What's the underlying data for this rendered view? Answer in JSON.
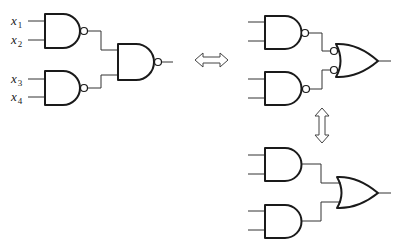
{
  "diagram": {
    "colors": {
      "stroke": "#1a1a1a",
      "wire": "#333333",
      "background": "#ffffff"
    },
    "inputs": [
      {
        "var": "x",
        "sub": "1"
      },
      {
        "var": "x",
        "sub": "2"
      },
      {
        "var": "x",
        "sub": "3"
      },
      {
        "var": "x",
        "sub": "4"
      }
    ],
    "circuits": [
      {
        "id": "nand-nand",
        "gates": [
          "NAND",
          "NAND",
          "NAND"
        ]
      },
      {
        "id": "nand-negor",
        "gates": [
          "NAND",
          "NAND",
          "OR with inverted inputs"
        ]
      },
      {
        "id": "and-or",
        "gates": [
          "AND",
          "AND",
          "OR"
        ]
      }
    ],
    "arrows": [
      {
        "name": "equivalence-horizontal",
        "symbol": "⇔"
      },
      {
        "name": "equivalence-vertical",
        "symbol": "⇕"
      }
    ]
  }
}
